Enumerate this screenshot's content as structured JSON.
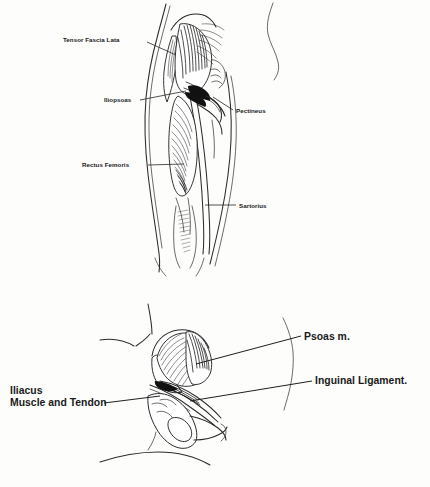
{
  "document": {
    "kind": "anatomical-illustration",
    "background_color": "#fdfdfc",
    "ink_color": "#1a1a1a"
  },
  "figures": [
    {
      "id": "anterior-thigh",
      "name": "Anterior thigh and hip musculature",
      "labels": [
        {
          "id": "tensor-fascia-lata",
          "text": "Tensor Fascia Lata",
          "side": "left",
          "text_x": 63,
          "text_y": 42,
          "leader": "M 147 42 L 176 55"
        },
        {
          "id": "iliopsoas",
          "text": "Iliopsoas",
          "side": "left",
          "text_x": 104,
          "text_y": 102,
          "leader": "M 140 100 L 186 91"
        },
        {
          "id": "rectus-femoris",
          "text": "Rectus Femoris",
          "side": "left",
          "text_x": 82,
          "text_y": 167,
          "leader": "M 148 165 L 184 164"
        },
        {
          "id": "pectineus",
          "text": "Pectineus",
          "side": "right",
          "text_x": 236,
          "text_y": 113,
          "leader": "M 233 110 L 213 97"
        },
        {
          "id": "sartorius",
          "text": "Sartorius",
          "side": "right",
          "text_x": 239,
          "text_y": 208,
          "leader": "M 236 205 L 205 205"
        }
      ]
    },
    {
      "id": "pelvis-iliopsoas",
      "name": "Pelvis with iliacus and psoas",
      "labels": [
        {
          "id": "psoas-m",
          "text": "Psoas m.",
          "side": "right",
          "text_x": 304,
          "text_y": 340,
          "leader": "M 301 336 L 196 364"
        },
        {
          "id": "inguinal-ligament",
          "text": "Inguinal Ligament.",
          "side": "right",
          "text_x": 315,
          "text_y": 384,
          "leader": "M 312 381 L 190 401"
        },
        {
          "id": "iliacus-muscle-and-tendon",
          "text_line_1": "Iliacus",
          "text_line_2": "Muscle and Tendon",
          "side": "left",
          "text_x": 10,
          "text_y_line_1": 394,
          "text_y_line_2": 406,
          "leader": "M 104 403 L 160 396"
        }
      ]
    }
  ]
}
